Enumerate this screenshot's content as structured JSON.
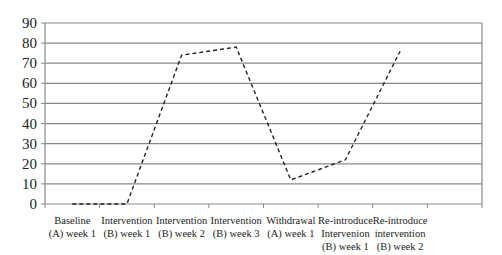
{
  "chart_data": {
    "type": "line",
    "title": "",
    "xlabel": "",
    "ylabel": "",
    "ylim": [
      0,
      90
    ],
    "yticks": [
      0,
      10,
      20,
      30,
      40,
      50,
      60,
      70,
      80,
      90
    ],
    "grid": true,
    "legend": null,
    "categories": [
      [
        "Baseline",
        "(A) week 1"
      ],
      [
        "Intervention",
        "(B) week 1"
      ],
      [
        "Intervention",
        "(B) week 2"
      ],
      [
        "Intervention",
        "(B) week 3"
      ],
      [
        "Withdrawal",
        "(A) week 1"
      ],
      [
        "Re-introduce",
        "Intervenion",
        "(B) week 1"
      ],
      [
        "Re-introduce",
        "intervention",
        "(B) week 2"
      ]
    ],
    "series": [
      {
        "name": "Series 1",
        "style": "dashed",
        "color": "#222222",
        "values": [
          0,
          0,
          74,
          78,
          12,
          22,
          76
        ]
      }
    ],
    "num_slots": 8
  },
  "colors": {
    "grid": "#888888",
    "axis": "#888888",
    "line": "#222222"
  }
}
